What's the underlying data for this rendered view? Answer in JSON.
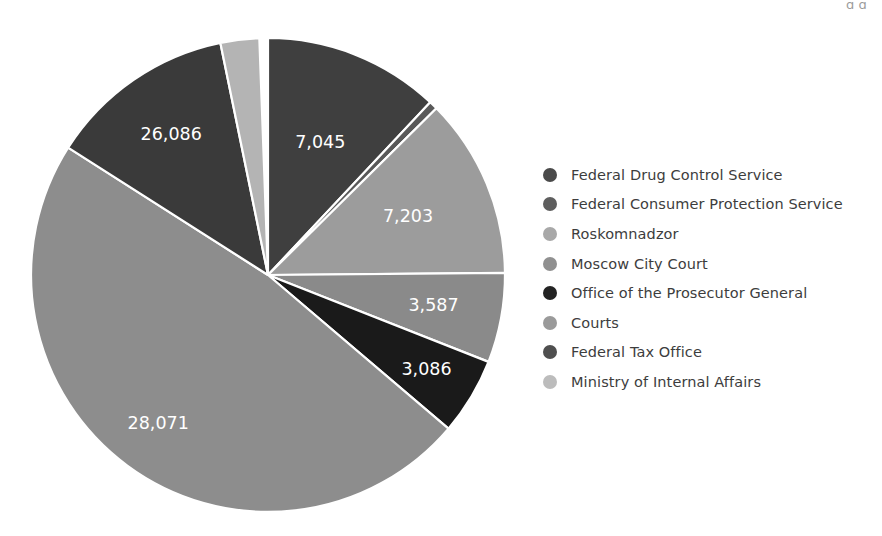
{
  "chart_data": {
    "type": "pie",
    "title": "",
    "subtitle": "",
    "xlabel": "",
    "ylabel": "",
    "grid": false,
    "legend_position": "right",
    "start_angle_deg": 0,
    "direction": "clockwise",
    "total": 75078,
    "center": {
      "x": 268,
      "y": 275
    },
    "radius": 237,
    "categories": [
      "Federal Drug Control Service",
      "Federal Consumer Protection Service",
      "Roskomnadzor",
      "Moscow City Court",
      "Office of the Prosecutor General",
      "Courts",
      "Federal Tax Office",
      "Ministry of Internal Affairs"
    ],
    "values": [
      7045,
      330,
      7203,
      3587,
      3086,
      28071,
      26086,
      1870
    ],
    "labels_shown": [
      "7,045",
      "",
      "7,203",
      "3,587",
      "3,086",
      "28,071",
      "26,086",
      ""
    ],
    "colors": [
      "#3f3f3f",
      "#595959",
      "#9c9c9c",
      "#8a8a8a",
      "#1a1a1a",
      "#8d8d8d",
      "#3a3a3a",
      "#b4b4b4"
    ]
  },
  "slices": [
    {
      "name": "Federal Drug Control Service",
      "value": 7045,
      "label": "7,045",
      "color": "#3f3f3f",
      "start_deg": 0,
      "end_deg": 43.2,
      "label_radius_frac": 0.6,
      "show_label": true
    },
    {
      "name": "Federal Consumer Protection Service",
      "value": 330,
      "label": "",
      "color": "#595959",
      "start_deg": 43.2,
      "end_deg": 45.3,
      "label_radius_frac": 0.6,
      "show_label": false
    },
    {
      "name": "Roskomnadzor",
      "value": 7203,
      "label": "7,203",
      "color": "#9c9c9c",
      "start_deg": 45.3,
      "end_deg": 89.5,
      "label_radius_frac": 0.64,
      "show_label": true
    },
    {
      "name": "Moscow City Court",
      "value": 3587,
      "label": "3,587",
      "color": "#8a8a8a",
      "start_deg": 89.5,
      "end_deg": 111.5,
      "label_radius_frac": 0.71,
      "show_label": true
    },
    {
      "name": "Office of the Prosecutor General",
      "value": 3086,
      "label": "3,086",
      "color": "#1a1a1a",
      "start_deg": 111.5,
      "end_deg": 130.4,
      "label_radius_frac": 0.78,
      "show_label": true
    },
    {
      "name": "Courts",
      "value": 28071,
      "label": "28,071",
      "color": "#8d8d8d",
      "start_deg": 130.4,
      "end_deg": 302.5,
      "label_radius_frac": 0.78,
      "show_label": true
    },
    {
      "name": "Federal Tax Office",
      "value": 26086,
      "label": "26,086",
      "color": "#3a3a3a",
      "start_deg": 302.5,
      "end_deg": 348.4,
      "label_radius_frac": 0.72,
      "show_label": true
    },
    {
      "name": "Ministry of Internal Affairs",
      "value": 1870,
      "label": "",
      "color": "#b4b4b4",
      "start_deg": 348.4,
      "end_deg": 357.9,
      "label_radius_frac": 0.6,
      "show_label": false
    }
  ],
  "legend": {
    "items": [
      {
        "label": "Federal Drug Control Service",
        "color": "#4a4a4a"
      },
      {
        "label": "Federal Consumer Protection Service",
        "color": "#5e5e5e"
      },
      {
        "label": "Roskomnadzor",
        "color": "#a8a8a8"
      },
      {
        "label": "Moscow City Court",
        "color": "#909090"
      },
      {
        "label": "Office of the Prosecutor General",
        "color": "#232323"
      },
      {
        "label": "Courts",
        "color": "#9a9a9a"
      },
      {
        "label": "Federal Tax Office",
        "color": "#4f4f4f"
      },
      {
        "label": "Ministry of Internal Affairs",
        "color": "#bcbcbc"
      }
    ]
  },
  "artifacts": {
    "top_title_remnant": "",
    "top_corner_remnant": "g g"
  }
}
